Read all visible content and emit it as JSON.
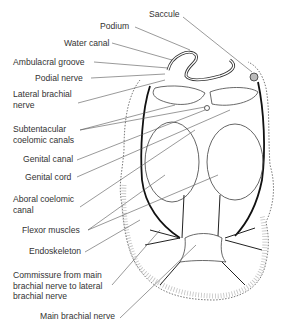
{
  "diagram": {
    "type": "anatomical cross-section",
    "labels": [
      {
        "id": "saccule",
        "text": "Saccule"
      },
      {
        "id": "podium",
        "text": "Podium"
      },
      {
        "id": "water-canal",
        "text": "Water canal"
      },
      {
        "id": "ambulacral-groove",
        "text": "Ambulacral groove"
      },
      {
        "id": "podial-nerve",
        "text": "Podial nerve"
      },
      {
        "id": "lateral-brachial-nerve",
        "text": "Lateral brachial nerve"
      },
      {
        "id": "subtentacular-coelomic-canals",
        "text": "Subtentacular coelomic canals"
      },
      {
        "id": "genital-canal",
        "text": "Genital canal"
      },
      {
        "id": "genital-cord",
        "text": "Genital cord"
      },
      {
        "id": "aboral-coelomic-canal",
        "text": "Aboral coelomic canal"
      },
      {
        "id": "flexor-muscles",
        "text": "Flexor muscles"
      },
      {
        "id": "endoskeleton",
        "text": "Endoskeleton"
      },
      {
        "id": "commissure",
        "text": "Commissure from main brachial nerve to lateral brachial nerve"
      },
      {
        "id": "main-brachial-nerve",
        "text": "Main brachial nerve"
      }
    ]
  }
}
